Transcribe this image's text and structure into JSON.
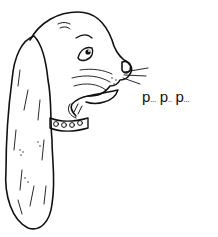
{
  "illustration": {
    "subject": "dog-head-profile-with-long-ear-and-collar",
    "style": "black-ink-line-drawing",
    "colors": {
      "ink": "#111111",
      "background": "#ffffff"
    }
  },
  "speech": {
    "parts": [
      "p",
      "...",
      " p",
      "..",
      " p",
      "..."
    ],
    "text": "p... p.. p..."
  }
}
